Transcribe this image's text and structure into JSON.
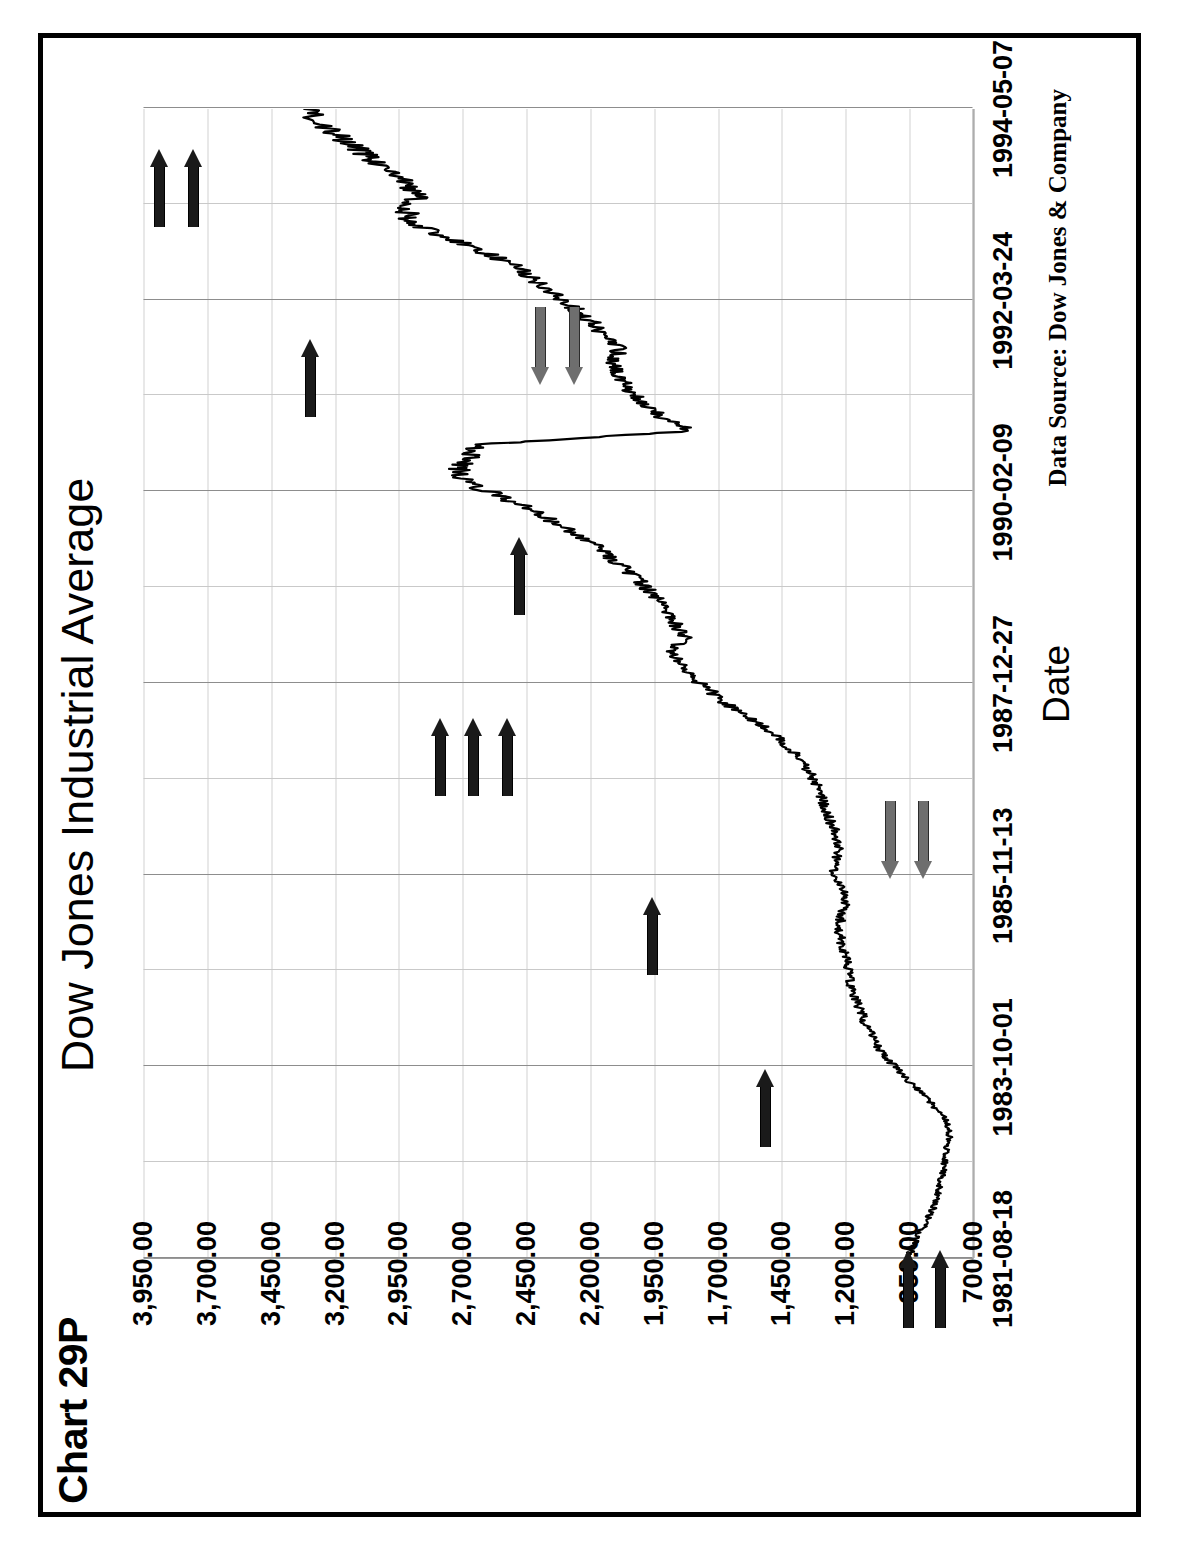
{
  "page": {
    "chart_id": "Chart 29P"
  },
  "chart_data": {
    "type": "line",
    "title": "Dow Jones Industrial Average",
    "xlabel": "Date",
    "ylabel": "Dow Industrials",
    "source_note": "Data Source:  Dow Jones & Company",
    "grid": true,
    "legend": "none",
    "ylim": [
      700,
      3950
    ],
    "ytick_labels": [
      "3,950.00",
      "3,700.00",
      "3,450.00",
      "3,200.00",
      "2,950.00",
      "2,700.00",
      "2,450.00",
      "2,200.00",
      "1,950.00",
      "1,700.00",
      "1,450.00",
      "1,200.00",
      "950.00",
      "700.00"
    ],
    "ytick_values": [
      3950,
      3700,
      3450,
      3200,
      2950,
      2700,
      2450,
      2200,
      1950,
      1700,
      1450,
      1200,
      950,
      700
    ],
    "xtick_labels": [
      "1981-08-18",
      "1983-10-01",
      "1985-11-13",
      "1987-12-27",
      "1990-02-09",
      "1992-03-24",
      "1994-05-07"
    ],
    "xlim": [
      "1981-08-18",
      "1994-05-07"
    ],
    "series": [
      {
        "name": "Dow Jones Industrial Average",
        "color": "#000000",
        "x": [
          0.0,
          0.012,
          0.024,
          0.036,
          0.048,
          0.06,
          0.072,
          0.084,
          0.096,
          0.108,
          0.12,
          0.132,
          0.144,
          0.156,
          0.168,
          0.18,
          0.192,
          0.204,
          0.216,
          0.228,
          0.24,
          0.252,
          0.264,
          0.276,
          0.288,
          0.3,
          0.312,
          0.324,
          0.336,
          0.348,
          0.36,
          0.372,
          0.384,
          0.396,
          0.408,
          0.42,
          0.432,
          0.444,
          0.456,
          0.468,
          0.48,
          0.492,
          0.504,
          0.516,
          0.528,
          0.54,
          0.552,
          0.564,
          0.576,
          0.588,
          0.6,
          0.612,
          0.624,
          0.636,
          0.648,
          0.66,
          0.672,
          0.684,
          0.696,
          0.708,
          0.72,
          0.732,
          0.744,
          0.756,
          0.768,
          0.78,
          0.792,
          0.804,
          0.816,
          0.828,
          0.84,
          0.852,
          0.864,
          0.876,
          0.888,
          0.9,
          0.912,
          0.924,
          0.936,
          0.948,
          0.96,
          0.972,
          0.984,
          1.0
        ],
        "y": [
          950,
          930,
          900,
          870,
          845,
          830,
          820,
          808,
          800,
          790,
          805,
          850,
          900,
          960,
          1010,
          1060,
          1090,
          1120,
          1140,
          1160,
          1180,
          1190,
          1200,
          1215,
          1225,
          1210,
          1195,
          1215,
          1240,
          1235,
          1225,
          1240,
          1265,
          1285,
          1305,
          1330,
          1370,
          1420,
          1480,
          1560,
          1650,
          1720,
          1790,
          1840,
          1880,
          1830,
          1865,
          1900,
          1950,
          2000,
          2060,
          2130,
          2200,
          2300,
          2400,
          2520,
          2650,
          2720,
          2680,
          2640,
          1800,
          1920,
          1990,
          2050,
          2090,
          2110,
          2080,
          2150,
          2200,
          2270,
          2340,
          2420,
          2500,
          2620,
          2750,
          2900,
          2920,
          2880,
          2930,
          3000,
          3080,
          3160,
          3240,
          3320
        ]
      }
    ],
    "annotations": [
      {
        "id": "a1",
        "label": "black-arrow-right",
        "style": "black",
        "direction": "right",
        "x": 0.008,
        "y": 960
      },
      {
        "id": "a2",
        "label": "black-arrow-right",
        "style": "black",
        "direction": "right",
        "x": 0.008,
        "y": 835
      },
      {
        "id": "a3",
        "label": "black-arrow-right",
        "style": "black",
        "direction": "right",
        "x": 0.165,
        "y": 1520
      },
      {
        "id": "a4",
        "label": "gray-arrow-left",
        "style": "gray",
        "direction": "left",
        "x": 0.33,
        "y": 1030
      },
      {
        "id": "a5",
        "label": "gray-arrow-left",
        "style": "gray",
        "direction": "left",
        "x": 0.33,
        "y": 900
      },
      {
        "id": "a6",
        "label": "black-arrow-right",
        "style": "black",
        "direction": "right",
        "x": 0.315,
        "y": 1960
      },
      {
        "id": "a7",
        "label": "black-arrow-right",
        "style": "black",
        "direction": "right",
        "x": 0.47,
        "y": 2790
      },
      {
        "id": "a8",
        "label": "black-arrow-right",
        "style": "black",
        "direction": "right",
        "x": 0.47,
        "y": 2660
      },
      {
        "id": "a9",
        "label": "black-arrow-right",
        "style": "black",
        "direction": "right",
        "x": 0.47,
        "y": 2530
      },
      {
        "id": "a10",
        "label": "black-arrow-right",
        "style": "black",
        "direction": "right",
        "x": 0.628,
        "y": 2480
      },
      {
        "id": "a11",
        "label": "gray-arrow-left",
        "style": "gray",
        "direction": "left",
        "x": 0.76,
        "y": 2400
      },
      {
        "id": "a12",
        "label": "gray-arrow-left",
        "style": "gray",
        "direction": "left",
        "x": 0.76,
        "y": 2265
      },
      {
        "id": "a13",
        "label": "black-arrow-right",
        "style": "black",
        "direction": "right",
        "x": 0.8,
        "y": 3300
      },
      {
        "id": "a14",
        "label": "black-arrow-right",
        "style": "black",
        "direction": "right",
        "x": 0.965,
        "y": 3890
      },
      {
        "id": "a15",
        "label": "black-arrow-right",
        "style": "black",
        "direction": "right",
        "x": 0.965,
        "y": 3760
      }
    ]
  }
}
